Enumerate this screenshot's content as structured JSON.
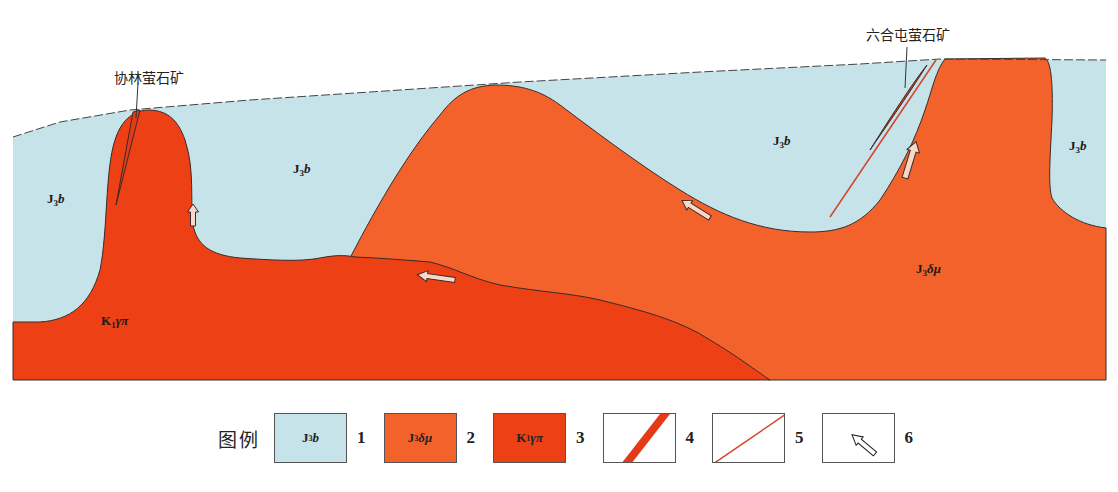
{
  "diagram": {
    "type": "geological-cross-section",
    "colors": {
      "J3b": "#c6e3ea",
      "J3dmu": "#f2622a",
      "K1gpi": "#ee4015",
      "orebody": "#e53a18",
      "fault": "#d2452a",
      "boundary": "#3a2a2a"
    },
    "mine_labels": {
      "left": "协林萤石矿",
      "right": "六合屯萤石矿"
    },
    "unit_labels": {
      "j3b_left": "J3b",
      "j3b_center": "J3b",
      "j3b_right_center": "J3b",
      "j3b_far_right": "J3b",
      "j3dmu": "J3δμ",
      "k1gpi": "K1γπ"
    }
  },
  "legend": {
    "title": "图例",
    "items": [
      {
        "id": 1,
        "symbol": "J3b",
        "num": "1",
        "kind": "fill",
        "color": "#c6e3ea"
      },
      {
        "id": 2,
        "symbol": "J3δμ",
        "num": "2",
        "kind": "fill",
        "color": "#f2622a"
      },
      {
        "id": 3,
        "symbol": "K1γπ",
        "num": "3",
        "kind": "fill",
        "color": "#ee4015"
      },
      {
        "id": 4,
        "symbol": "",
        "num": "4",
        "kind": "orebody"
      },
      {
        "id": 5,
        "symbol": "",
        "num": "5",
        "kind": "fault"
      },
      {
        "id": 6,
        "symbol": "",
        "num": "6",
        "kind": "arrow"
      }
    ]
  }
}
